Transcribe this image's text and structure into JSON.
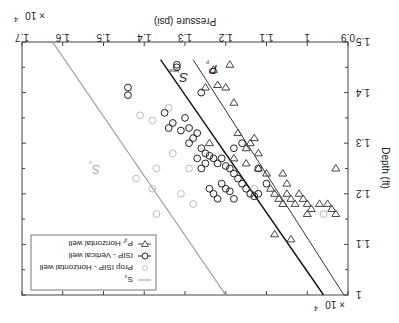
{
  "chart_data": {
    "type": "scatter",
    "orientation_note": "figure rendered rotated 180 degrees",
    "title": "",
    "xlabel": "Pressure (psi)",
    "ylabel": "Depth (ft)",
    "x_multiplier": "×10^4",
    "y_multiplier": "×10^4",
    "xlim": [
      0.9,
      1.7
    ],
    "ylim": [
      1.0,
      1.5
    ],
    "x_ticks": [
      "0.9",
      "1",
      "1.1",
      "1.2",
      "1.3",
      "1.4",
      "1.5",
      "1.6",
      "1.7"
    ],
    "y_ticks": [
      "1",
      "1.1",
      "1.2",
      "1.3",
      "1.4",
      "1.5"
    ],
    "grid": false,
    "legend_position": "upper-left (as rendered: lower-left rotated)",
    "legend": [
      {
        "label": "S_v",
        "style": "gray line"
      },
      {
        "label": "Prop ISIP - Horizontal well",
        "style": "light gray circle"
      },
      {
        "label": "ISIP - Vertical well",
        "style": "black circle"
      },
      {
        "label": "P_p - Horizontal well",
        "style": "triangle"
      }
    ],
    "annotations": [
      "S_v",
      "S_hmin",
      "P_p"
    ],
    "series": [
      {
        "name": "S_v",
        "type": "line",
        "points": [
          [
            1.2,
            1.0
          ],
          [
            1.625,
            1.5
          ]
        ]
      },
      {
        "name": "S_hmin",
        "type": "line",
        "points": [
          [
            0.96,
            1.0
          ],
          [
            1.36,
            1.465
          ]
        ]
      },
      {
        "name": "P_p trend",
        "type": "line",
        "points": [
          [
            0.91,
            1.0
          ],
          [
            1.28,
            1.465
          ]
        ]
      },
      {
        "name": "ISIP - Vertical well",
        "type": "scatter",
        "points": [
          [
            1.44,
            1.41
          ],
          [
            1.44,
            1.395
          ],
          [
            1.35,
            1.36
          ],
          [
            1.32,
            1.45
          ],
          [
            1.32,
            1.455
          ],
          [
            1.26,
            1.4
          ],
          [
            1.3,
            1.35
          ],
          [
            1.34,
            1.33
          ],
          [
            1.33,
            1.34
          ],
          [
            1.31,
            1.325
          ],
          [
            1.29,
            1.33
          ],
          [
            1.28,
            1.31
          ],
          [
            1.27,
            1.32
          ],
          [
            1.26,
            1.29
          ],
          [
            1.25,
            1.28
          ],
          [
            1.24,
            1.275
          ],
          [
            1.23,
            1.27
          ],
          [
            1.22,
            1.26
          ],
          [
            1.21,
            1.27
          ],
          [
            1.2,
            1.255
          ],
          [
            1.19,
            1.25
          ],
          [
            1.18,
            1.24
          ],
          [
            1.17,
            1.23
          ],
          [
            1.16,
            1.22
          ],
          [
            1.15,
            1.21
          ],
          [
            1.14,
            1.2
          ],
          [
            1.13,
            1.195
          ],
          [
            1.12,
            1.2
          ],
          [
            1.21,
            1.22
          ],
          [
            1.2,
            1.21
          ],
          [
            1.19,
            1.205
          ],
          [
            1.18,
            1.19
          ],
          [
            1.22,
            1.19
          ],
          [
            1.23,
            1.2
          ],
          [
            1.24,
            1.21
          ],
          [
            1.16,
            1.3
          ],
          [
            1.18,
            1.29
          ],
          [
            1.12,
            1.25
          ],
          [
            1.1,
            1.22
          ],
          [
            1.27,
            1.27
          ],
          [
            1.25,
            1.26
          ],
          [
            1.26,
            1.25
          ],
          [
            1.29,
            1.3
          ]
        ]
      },
      {
        "name": "Prop ISIP - Horizontal well",
        "type": "scatter",
        "points": [
          [
            1.41,
            1.355
          ],
          [
            1.38,
            1.345
          ],
          [
            1.34,
            1.37
          ],
          [
            1.29,
            1.25
          ],
          [
            1.33,
            1.28
          ],
          [
            1.37,
            1.25
          ],
          [
            1.42,
            1.23
          ],
          [
            1.38,
            1.21
          ],
          [
            1.31,
            1.2
          ],
          [
            1.13,
            1.21
          ],
          [
            0.96,
            1.16
          ],
          [
            1.37,
            1.16
          ],
          [
            1.28,
            1.18
          ]
        ]
      },
      {
        "name": "P_p - Horizontal well",
        "type": "scatter",
        "points": [
          [
            1.23,
            1.445
          ],
          [
            1.19,
            1.455
          ],
          [
            1.22,
            1.415
          ],
          [
            1.2,
            1.41
          ],
          [
            1.18,
            1.38
          ],
          [
            1.25,
            1.41
          ],
          [
            1.24,
            1.3
          ],
          [
            1.17,
            1.32
          ],
          [
            1.13,
            1.31
          ],
          [
            1.15,
            1.29
          ],
          [
            1.14,
            1.3
          ],
          [
            1.12,
            1.28
          ],
          [
            1.18,
            1.27
          ],
          [
            1.15,
            1.26
          ],
          [
            1.12,
            1.25
          ],
          [
            1.1,
            1.24
          ],
          [
            1.06,
            1.24
          ],
          [
            1.05,
            1.22
          ],
          [
            1.02,
            1.2
          ],
          [
            1.01,
            1.19
          ],
          [
            1.0,
            1.18
          ],
          [
            0.99,
            1.17
          ],
          [
            1.09,
            1.21
          ],
          [
            1.08,
            1.2
          ],
          [
            1.07,
            1.19
          ],
          [
            1.06,
            1.18
          ],
          [
            1.05,
            1.2
          ],
          [
            1.04,
            1.19
          ],
          [
            1.03,
            1.18
          ],
          [
            1.0,
            1.16
          ],
          [
            0.97,
            1.18
          ],
          [
            0.95,
            1.18
          ],
          [
            0.94,
            1.17
          ],
          [
            0.93,
            1.16
          ],
          [
            0.93,
            1.25
          ],
          [
            1.08,
            1.12
          ],
          [
            1.04,
            1.11
          ]
        ]
      }
    ]
  },
  "labels": {
    "xlabel": "Pressure (psi)",
    "ylabel": "Depth (ft)",
    "x_mult": "× 10",
    "x_mult_exp": "4",
    "y_mult": "× 10",
    "y_mult_exp": "4",
    "sv": "S",
    "sv_sub": "v",
    "shmin": "S",
    "shmin_sub": "hmin",
    "pp": "P",
    "pp_sub": "p",
    "legend": [
      "S",
      "Prop ISIP - Horizontal well",
      "ISIP - Vertical well",
      "P  - Horizontal well"
    ],
    "legend_sub": [
      "v",
      "p"
    ]
  }
}
